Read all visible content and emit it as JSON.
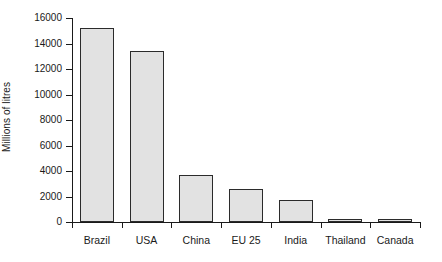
{
  "chart_data": {
    "type": "bar",
    "title": "",
    "xlabel": "",
    "ylabel": "Millions of litres",
    "categories": [
      "Brazil",
      "USA",
      "China",
      "EU 25",
      "India",
      "Thailand",
      "Canada"
    ],
    "values": [
      15200,
      13400,
      3700,
      2600,
      1750,
      250,
      250
    ],
    "ylim": [
      0,
      16000
    ],
    "ytick_labels": [
      "16000",
      "14000",
      "12000",
      "10000",
      "8000",
      "6000",
      "4000",
      "2000",
      "0"
    ],
    "ytick_values": [
      16000,
      14000,
      12000,
      10000,
      8000,
      6000,
      4000,
      2000,
      0
    ],
    "grid": false,
    "legend": null,
    "series": [
      {
        "name": "Ethanol production",
        "values": [
          15200,
          13400,
          3700,
          2600,
          1750,
          250,
          250
        ]
      }
    ],
    "bar_fill_color": "#e2e2e2",
    "bar_border_color": "#2b2b2b",
    "axis_color": "#1a1a1a",
    "background_color": "#ffffff"
  }
}
